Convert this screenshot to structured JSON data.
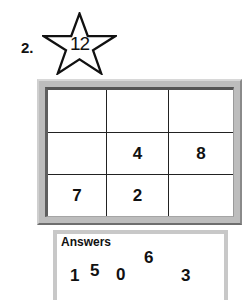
{
  "problem": {
    "number_label": "2.",
    "star_value": "12"
  },
  "grid": {
    "rows": [
      [
        "",
        "",
        ""
      ],
      [
        "",
        "4",
        "8"
      ],
      [
        "7",
        "2",
        ""
      ]
    ]
  },
  "answers": {
    "title": "Answers",
    "values": [
      "1",
      "5",
      "0",
      "6",
      "3"
    ]
  }
}
